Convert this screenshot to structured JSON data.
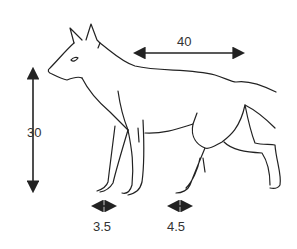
{
  "diagram": {
    "measurements": {
      "body_length": "40",
      "shoulder_height": "30",
      "fore_foot_width": "3.5",
      "hind_foot_width": "4.5"
    },
    "colors": {
      "line": "#222222",
      "text": "#333333",
      "background": "#ffffff"
    }
  }
}
